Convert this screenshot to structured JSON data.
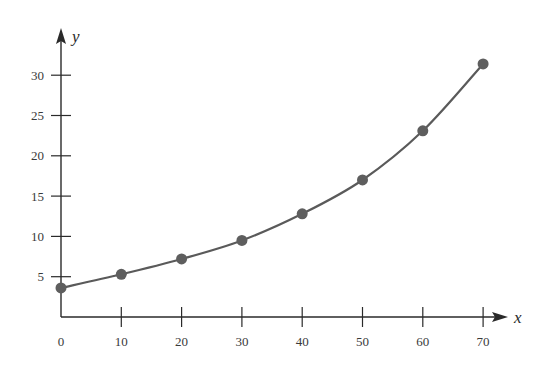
{
  "chart_data": {
    "type": "line",
    "title": "",
    "xlabel": "x",
    "ylabel": "y",
    "xlim": [
      0,
      70
    ],
    "ylim": [
      0,
      33
    ],
    "grid": false,
    "legend": null,
    "x_ticks": [
      0,
      10,
      20,
      30,
      40,
      50,
      60,
      70
    ],
    "y_ticks": [
      5,
      10,
      15,
      20,
      25,
      30
    ],
    "series": [
      {
        "name": "data",
        "markers": true,
        "smooth": true,
        "x": [
          0,
          10,
          20,
          30,
          40,
          50,
          60,
          70
        ],
        "y": [
          3.6,
          5.3,
          7.2,
          9.5,
          12.8,
          17.0,
          23.1,
          31.4
        ]
      }
    ]
  },
  "colors": {
    "axis": "#2a2a2a",
    "line": "#5a5a5a",
    "marker": "#5e5e5e"
  }
}
